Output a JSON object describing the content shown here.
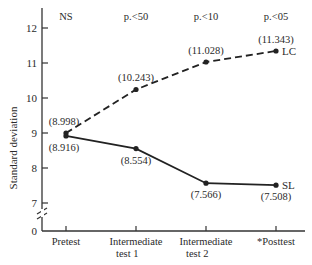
{
  "chart_data": {
    "type": "line",
    "title": "",
    "xlabel": "",
    "ylabel": "Standard deviation",
    "categories": [
      "Pretest",
      "Intermediate test 1",
      "Intermediate test 2",
      "*Posttest"
    ],
    "category_lines": [
      [
        "Pretest"
      ],
      [
        "Intermediate",
        "test 1"
      ],
      [
        "Intermediate",
        "test 2"
      ],
      [
        "*Posttest"
      ]
    ],
    "significance": [
      "NS",
      "p.<50",
      "p.<10",
      "p.<05"
    ],
    "yticks": [
      0,
      7,
      8,
      9,
      10,
      11,
      12
    ],
    "ylim": [
      7,
      12.5
    ],
    "axis_break": true,
    "grid": false,
    "legend_position": "inline-right",
    "series": [
      {
        "name": "LC",
        "style": "dashed",
        "values": [
          8.998,
          10.243,
          11.028,
          11.343
        ],
        "labels": [
          "(8.998)",
          "(10.243)",
          "(11.028)",
          "(11.343)"
        ]
      },
      {
        "name": "SL",
        "style": "solid",
        "values": [
          8.916,
          8.554,
          7.566,
          7.508
        ],
        "labels": [
          "(8.916)",
          "(8.554)",
          "(7.566)",
          "(7.508)"
        ]
      }
    ]
  }
}
